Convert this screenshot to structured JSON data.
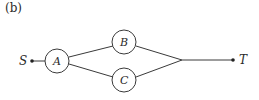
{
  "figure": {
    "caption": "(b)",
    "nodes": [
      {
        "id": "S",
        "label": "S",
        "type": "terminal"
      },
      {
        "id": "A",
        "label": "A",
        "type": "component"
      },
      {
        "id": "B",
        "label": "B",
        "type": "component"
      },
      {
        "id": "C",
        "label": "C",
        "type": "component"
      },
      {
        "id": "T",
        "label": "T",
        "type": "terminal"
      }
    ],
    "edges": [
      {
        "from": "S",
        "to": "A"
      },
      {
        "from": "A",
        "to": "B"
      },
      {
        "from": "A",
        "to": "C"
      },
      {
        "from": "B",
        "to": "T"
      },
      {
        "from": "C",
        "to": "T"
      }
    ]
  },
  "colors": {
    "line": "#3a3a3a",
    "background": "#ffffff"
  }
}
